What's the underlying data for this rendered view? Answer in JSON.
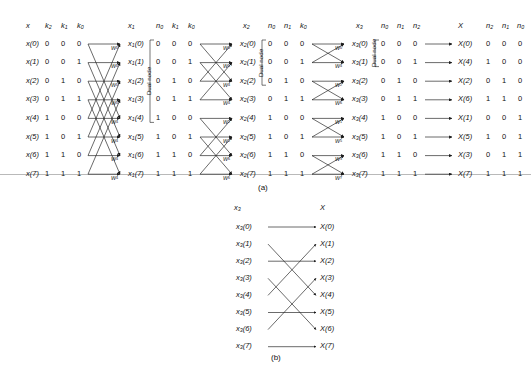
{
  "figure": {
    "panel_a_label": "(a)",
    "panel_b_label": "(b)",
    "dual_node_label": "Dual node"
  },
  "headers": {
    "x": "x",
    "k2": "k",
    "k2_sub": "2",
    "k1": "k",
    "k1_sub": "1",
    "k0": "k",
    "k0_sub": "0",
    "x1": "x",
    "x1_sub": "1",
    "n0": "n",
    "n0_sub": "0",
    "x2": "x",
    "x2_sub": "2",
    "n1": "n",
    "n1_sub": "1",
    "x3": "x",
    "x3_sub": "3",
    "n2": "n",
    "n2_sub": "2",
    "X": "X"
  },
  "columns": {
    "input_labels": [
      "x(0)",
      "x(1)",
      "x(2)",
      "x(3)",
      "x(4)",
      "x(5)",
      "x(6)",
      "x(7)"
    ],
    "bits_k2k1k0": [
      "0 0 0",
      "0 0 1",
      "0 1 0",
      "0 1 1",
      "1 0 0",
      "1 0 1",
      "1 1 0",
      "1 1 1"
    ],
    "stage1_out": [
      "x1(0)",
      "x1(1)",
      "x1(2)",
      "x1(3)",
      "x1(4)",
      "x1(5)",
      "x1(6)",
      "x1(7)"
    ],
    "bits_n0k1k0": [
      "0 0 0",
      "0 0 1",
      "0 1 0",
      "0 1 1",
      "1 0 0",
      "1 0 1",
      "1 1 0",
      "1 1 1"
    ],
    "stage2_out": [
      "x2(0)",
      "x2(1)",
      "x2(2)",
      "x2(3)",
      "x2(4)",
      "x2(5)",
      "x2(6)",
      "x2(7)"
    ],
    "bits_n0n1k0": [
      "0 0 0",
      "0 0 1",
      "0 1 0",
      "0 1 1",
      "1 0 0",
      "1 0 1",
      "1 1 0",
      "1 1 1"
    ],
    "stage3_out": [
      "x3(0)",
      "x3(1)",
      "x3(2)",
      "x3(3)",
      "x3(4)",
      "x3(5)",
      "x3(6)",
      "x3(7)"
    ],
    "bits_n0n1n2": [
      "0 0 0",
      "0 0 1",
      "0 1 0",
      "0 1 1",
      "1 0 0",
      "1 0 1",
      "1 1 0",
      "1 1 1"
    ],
    "output_labels": [
      "X(0)",
      "X(4)",
      "X(2)",
      "X(6)",
      "X(1)",
      "X(5)",
      "X(3)",
      "X(7)"
    ],
    "bits_n2n1n0": [
      "0 0 0",
      "1 0 0",
      "0 1 0",
      "1 1 0",
      "0 0 1",
      "1 0 1",
      "0 1 1",
      "1 1 1"
    ]
  },
  "twiddles": {
    "stage1": [
      "0",
      "0",
      "0",
      "0",
      "4",
      "4",
      "4",
      "4"
    ],
    "stage2": [
      "0",
      "0",
      "4",
      "4",
      "2",
      "2",
      "6",
      "6"
    ],
    "stage3": [
      "0",
      "4",
      "2",
      "6",
      "1",
      "5",
      "3",
      "7"
    ],
    "symbol": "W"
  },
  "panel_b": {
    "left_header": "x",
    "left_header_sub": "3",
    "right_header": "X",
    "left_labels": [
      "x3(0)",
      "x3(1)",
      "x3(2)",
      "x3(3)",
      "x3(4)",
      "x3(5)",
      "x3(6)",
      "x3(7)"
    ],
    "right_labels": [
      "X(0)",
      "X(1)",
      "X(2)",
      "X(3)",
      "X(4)",
      "X(5)",
      "X(6)",
      "X(7)"
    ],
    "mapping": [
      0,
      4,
      2,
      6,
      1,
      5,
      3,
      7
    ]
  },
  "colors": {
    "line": "#1a1a1a",
    "rule": "#b9b9b9",
    "text": "#111111"
  }
}
